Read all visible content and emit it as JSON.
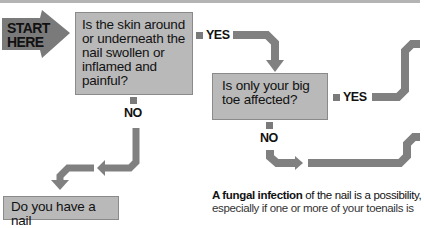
{
  "diagram": {
    "start": {
      "line1": "START",
      "line2": "HERE"
    },
    "questions": [
      {
        "id": "q1",
        "text": "Is the skin around or underneath the nail swollen or inflamed and painful?"
      },
      {
        "id": "q2",
        "text": "Is only your big toe affected?"
      },
      {
        "id": "q3",
        "text": "Do you have a nail"
      }
    ],
    "branches": {
      "q1_yes": "YES",
      "q1_no": "NO",
      "q2_yes": "YES",
      "q2_no": "NO"
    },
    "conclusion": {
      "bold": "A fungal infection",
      "rest": " of the nail is a possibility,",
      "line2": "especially if one or more of your toenails is"
    },
    "colors": {
      "box_fill": "#b9b9b9",
      "arrow": "#808080",
      "start_arrow": "#7a7a7a",
      "text": "#111111"
    }
  }
}
